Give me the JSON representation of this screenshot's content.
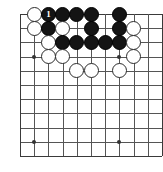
{
  "diagram": {
    "board": {
      "cols": 11,
      "rows": 11,
      "origin_x": 20,
      "origin_y": 14,
      "spacing": 14.2,
      "line_color": "#555555",
      "edge_color": "#3a3a3a",
      "background_color": "#ffffff"
    },
    "hoshi_points": [
      {
        "col": 2,
        "row": 4,
        "name": "star-point-left"
      },
      {
        "col": 8,
        "row": 4,
        "name": "star-point-upper-right"
      },
      {
        "col": 2,
        "row": 10,
        "name": "star-point-lower-left"
      },
      {
        "col": 8,
        "row": 10,
        "name": "star-point-lower-right"
      }
    ],
    "stone_colors": {
      "black": "#141414",
      "white": "#ffffff",
      "white_outline": "#2b2b2b",
      "black_label": "#ffffff"
    },
    "stone_diameter": 15,
    "stones": [
      {
        "col": 2,
        "row": 1,
        "color": "white",
        "label": ""
      },
      {
        "col": 3,
        "row": 1,
        "color": "black",
        "label": "1"
      },
      {
        "col": 4,
        "row": 1,
        "color": "black",
        "label": ""
      },
      {
        "col": 5,
        "row": 1,
        "color": "black",
        "label": ""
      },
      {
        "col": 6,
        "row": 1,
        "color": "black",
        "label": ""
      },
      {
        "col": 8,
        "row": 1,
        "color": "black",
        "label": ""
      },
      {
        "col": 2,
        "row": 2,
        "color": "white",
        "label": ""
      },
      {
        "col": 3,
        "row": 2,
        "color": "black",
        "label": ""
      },
      {
        "col": 4,
        "row": 2,
        "color": "white",
        "label": ""
      },
      {
        "col": 6,
        "row": 2,
        "color": "black",
        "label": ""
      },
      {
        "col": 8,
        "row": 2,
        "color": "black",
        "label": ""
      },
      {
        "col": 9,
        "row": 2,
        "color": "white",
        "label": ""
      },
      {
        "col": 3,
        "row": 3,
        "color": "white",
        "label": ""
      },
      {
        "col": 4,
        "row": 3,
        "color": "black",
        "label": ""
      },
      {
        "col": 5,
        "row": 3,
        "color": "black",
        "label": ""
      },
      {
        "col": 6,
        "row": 3,
        "color": "black",
        "label": ""
      },
      {
        "col": 7,
        "row": 3,
        "color": "black",
        "label": ""
      },
      {
        "col": 8,
        "row": 3,
        "color": "black",
        "label": ""
      },
      {
        "col": 9,
        "row": 3,
        "color": "white",
        "label": ""
      },
      {
        "col": 3,
        "row": 4,
        "color": "white",
        "label": ""
      },
      {
        "col": 4,
        "row": 4,
        "color": "white",
        "label": ""
      },
      {
        "col": 9,
        "row": 4,
        "color": "white",
        "label": ""
      },
      {
        "col": 5,
        "row": 5,
        "color": "white",
        "label": ""
      },
      {
        "col": 6,
        "row": 5,
        "color": "white",
        "label": ""
      },
      {
        "col": 8,
        "row": 5,
        "color": "white",
        "label": ""
      }
    ]
  }
}
